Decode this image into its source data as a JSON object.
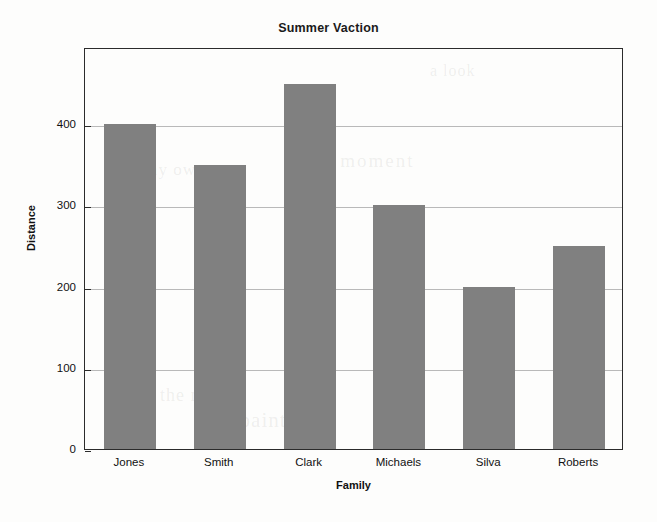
{
  "chart_data": {
    "type": "bar",
    "title": "Summer Vaction",
    "xlabel": "Family",
    "ylabel": "Distance",
    "categories": [
      "Jones",
      "Smith",
      "Clark",
      "Michaels",
      "Silva",
      "Roberts"
    ],
    "values": [
      400,
      350,
      450,
      300,
      200,
      250
    ],
    "yticks": [
      0,
      100,
      200,
      300,
      400
    ],
    "ytick_labels": [
      "0",
      "100",
      "200",
      "300",
      "400"
    ],
    "ylim": [
      0,
      495
    ],
    "grid": true,
    "legend": null,
    "bar_color": "#808080",
    "frame_color": "#2b2b2b",
    "grid_color": "#b9b9b9",
    "background": "#fdfdfc"
  },
  "artifacts": {
    "bleed_through": [
      "one moment",
      "on my own",
      "the night",
      "and paint",
      "a look",
      "to be"
    ]
  }
}
